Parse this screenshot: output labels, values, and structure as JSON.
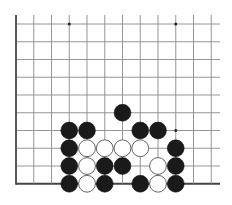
{
  "diagram": {
    "type": "go-board-fragment",
    "columns": 12,
    "rows": 10,
    "edges": [
      "left",
      "bottom"
    ],
    "colors": {
      "background": "#ffffff",
      "grid": "#8a8a8a",
      "edge": "#444444",
      "black_stone": "#1a1a1a",
      "white_stone": "#ffffff"
    },
    "star_points": [
      {
        "col": 3,
        "row": 0
      },
      {
        "col": 9,
        "row": 0
      },
      {
        "col": 9,
        "row": 6
      }
    ],
    "stones": [
      {
        "color": "black",
        "col": 6,
        "row": 5
      },
      {
        "color": "black",
        "col": 3,
        "row": 6
      },
      {
        "color": "black",
        "col": 4,
        "row": 6
      },
      {
        "color": "black",
        "col": 7,
        "row": 6
      },
      {
        "color": "black",
        "col": 8,
        "row": 6
      },
      {
        "color": "black",
        "col": 3,
        "row": 7
      },
      {
        "color": "white",
        "col": 4,
        "row": 7
      },
      {
        "color": "white",
        "col": 5,
        "row": 7
      },
      {
        "color": "white",
        "col": 6,
        "row": 7
      },
      {
        "color": "white",
        "col": 7,
        "row": 7
      },
      {
        "color": "black",
        "col": 9,
        "row": 7
      },
      {
        "color": "black",
        "col": 3,
        "row": 8
      },
      {
        "color": "white",
        "col": 4,
        "row": 8
      },
      {
        "color": "black",
        "col": 5,
        "row": 8
      },
      {
        "color": "black",
        "col": 6,
        "row": 8
      },
      {
        "color": "white",
        "col": 8,
        "row": 8
      },
      {
        "color": "black",
        "col": 9,
        "row": 8
      },
      {
        "color": "black",
        "col": 3,
        "row": 9
      },
      {
        "color": "white",
        "col": 4,
        "row": 9
      },
      {
        "color": "black",
        "col": 5,
        "row": 9
      },
      {
        "color": "black",
        "col": 7,
        "row": 9
      },
      {
        "color": "white",
        "col": 8,
        "row": 9
      },
      {
        "color": "black",
        "col": 9,
        "row": 9
      }
    ]
  }
}
